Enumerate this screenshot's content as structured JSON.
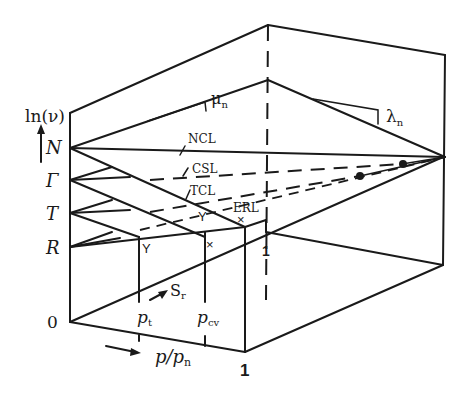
{
  "figure": {
    "type": "3d-line-diagram"
  },
  "axes": {
    "vertical_label": "ln(ν)",
    "horizontal_label": "p/p",
    "horizontal_label_sub": "n",
    "origin_label": "0",
    "front_one_label": "1",
    "back_one_label": "1",
    "depth_label": "S",
    "depth_label_sub": "r"
  },
  "vertical_ticks": [
    {
      "label": "N"
    },
    {
      "label": "Γ"
    },
    {
      "label": "T"
    },
    {
      "label": "R"
    }
  ],
  "horizontal_ticks": [
    {
      "label": "p",
      "sub": "t"
    },
    {
      "label": "p",
      "sub": "cv"
    }
  ],
  "lines": {
    "ncl": "NCL",
    "csl": "CSL",
    "tcl": "TCL",
    "erl": "ERL"
  },
  "slopes": {
    "mu": "μ",
    "mu_sub": "n",
    "lambda": "λ",
    "lambda_sub": "n"
  },
  "markers": {
    "y_marker": "Y",
    "x_marker": "×"
  }
}
